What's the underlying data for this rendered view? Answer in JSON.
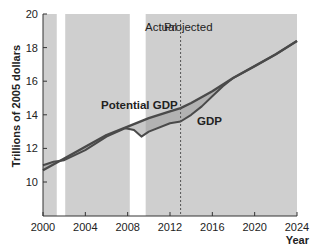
{
  "chart_data": {
    "type": "line",
    "title": "",
    "xlabel": "Year",
    "ylabel": "Trillions of 2005 dollars",
    "xlim": [
      2000,
      2024
    ],
    "ylim": [
      7.5,
      20
    ],
    "xticks": [
      2000,
      2004,
      2008,
      2012,
      2016,
      2020,
      2024
    ],
    "yticks": [
      10,
      12,
      14,
      16,
      18,
      20
    ],
    "grid": false,
    "legend": "none (inline labels)",
    "annotations": [
      {
        "text": "Actual",
        "x": 2012.2,
        "y": 19.3
      },
      {
        "text": "Projected",
        "x": 2013.4,
        "y": 19.3
      },
      {
        "text": "Potential GDP",
        "x": 2006.0,
        "y": 14.1
      },
      {
        "text": "GDP",
        "x": 2014.5,
        "y": 12.9
      }
    ],
    "divider": {
      "x": 2013,
      "style": "dashed",
      "label_left": "Actual",
      "label_right": "Projected"
    },
    "shaded_regions": [
      {
        "from": 2000,
        "to": 2001.3
      },
      {
        "from": 2002.1,
        "to": 2008.2
      },
      {
        "from": 2009.7,
        "to": 2024.0
      }
    ],
    "series": [
      {
        "name": "Potential GDP",
        "x": [
          2000,
          2002,
          2004,
          2006,
          2008,
          2010,
          2012,
          2013,
          2014,
          2016,
          2018,
          2020,
          2022,
          2024
        ],
        "values": [
          10.7,
          11.4,
          12.1,
          12.8,
          13.3,
          13.8,
          14.2,
          14.4,
          14.7,
          15.4,
          16.2,
          16.9,
          17.6,
          18.4
        ]
      },
      {
        "name": "GDP",
        "x": [
          2000,
          2001,
          2002,
          2004,
          2006,
          2007.8,
          2008.6,
          2009.3,
          2010,
          2012,
          2013,
          2014,
          2015,
          2016,
          2017,
          2018,
          2020,
          2022,
          2024
        ],
        "values": [
          11.0,
          11.2,
          11.3,
          11.9,
          12.7,
          13.2,
          13.1,
          12.7,
          13.0,
          13.5,
          13.6,
          14.0,
          14.5,
          15.1,
          15.7,
          16.2,
          16.9,
          17.6,
          18.4
        ]
      }
    ]
  },
  "axes": {
    "ylabel": "Trillions of 2005 dollars",
    "xlabel": "Year",
    "xticks": [
      "2000",
      "2004",
      "2008",
      "2012",
      "2016",
      "2020",
      "2024"
    ],
    "yticks": [
      "10",
      "12",
      "14",
      "16",
      "18",
      "20"
    ]
  },
  "labels": {
    "actual": "Actual",
    "projected": "Projected",
    "potential_gdp": "Potential GDP",
    "gdp": "GDP"
  },
  "colors": {
    "shade": "#cfcfcf",
    "gap_fill": "#9a9a9a",
    "line": "#4a4a4a",
    "axis": "#333333"
  }
}
